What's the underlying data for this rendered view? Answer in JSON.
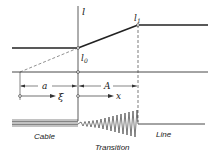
{
  "diagram": {
    "axis_label": "l",
    "cable_value_label": "l",
    "cable_value_sub": "0",
    "line_value_label": "l",
    "line_value_sub": "1",
    "dim_a": "a",
    "dim_A": "A",
    "coord_xi": "ξ",
    "coord_x": "x",
    "regions": {
      "cable": "Cable",
      "transition": "Transition",
      "line": "Line"
    },
    "colors": {
      "ink": "#222222",
      "background": "#ffffff"
    }
  }
}
